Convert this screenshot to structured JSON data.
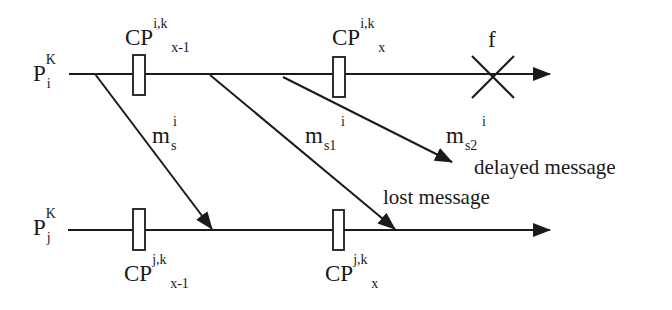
{
  "diagram": {
    "type": "process-timeline-checkpoint",
    "colors": {
      "ink": "#1a1a1a",
      "background": "#ffffff"
    },
    "processes": [
      {
        "id": "Pi",
        "label_base": "P",
        "label_sub": "i",
        "label_sup": "K",
        "line_y": 74
      },
      {
        "id": "Pj",
        "label_base": "P",
        "label_sub": "j",
        "label_sup": "K",
        "line_y": 230
      }
    ],
    "checkpoints": [
      {
        "process": "Pi",
        "base": "CP",
        "sup": "i,k",
        "sub": "x-1",
        "x": 139,
        "label_position": "above"
      },
      {
        "process": "Pi",
        "base": "CP",
        "sup": "i,k",
        "sub": "x",
        "x": 340,
        "label_position": "above"
      },
      {
        "process": "Pj",
        "base": "CP",
        "sup": "j,k",
        "sub": "x-1",
        "x": 139,
        "label_position": "below"
      },
      {
        "process": "Pj",
        "base": "CP",
        "sup": "j,k",
        "sub": "x",
        "x": 339,
        "label_position": "below"
      }
    ],
    "failure": {
      "label": "f",
      "process": "Pi",
      "x": 493,
      "icon": "cross-icon"
    },
    "messages": [
      {
        "name": "m_s",
        "base": "m",
        "sub": "s",
        "sup": "i",
        "from": [
          95,
          74
        ],
        "to": [
          212,
          230
        ]
      },
      {
        "name": "m_s1",
        "base": "m",
        "sub": "s1",
        "sup": "i",
        "from": [
          210,
          75
        ],
        "to": [
          395,
          230
        ]
      },
      {
        "name": "m_s2",
        "base": "m",
        "sub": "s2",
        "sup": "i",
        "from": [
          283,
          77
        ],
        "to": [
          452,
          162
        ]
      }
    ],
    "annotations": {
      "delayed": "delayed message",
      "lost": "lost message"
    }
  }
}
